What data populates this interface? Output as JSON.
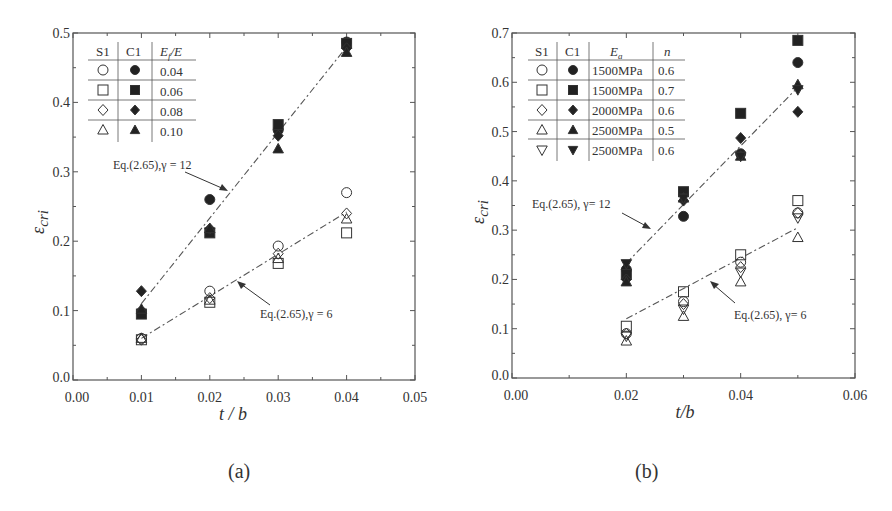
{
  "chart_data": [
    {
      "panel": "(a)",
      "type": "scatter",
      "xlabel": "t / b",
      "ylabel": "ε_cri",
      "xlim": [
        0.0,
        0.05
      ],
      "ylim": [
        0.0,
        0.5
      ],
      "xticks": [
        "0.00",
        "0.01",
        "0.02",
        "0.03",
        "0.04",
        "0.05"
      ],
      "yticks": [
        "0.0",
        "0.1",
        "0.2",
        "0.3",
        "0.4",
        "0.5"
      ],
      "grid": false,
      "legend": {
        "position": "upper-left",
        "headers": [
          "S1",
          "C1",
          "E_f/E"
        ],
        "rows": [
          {
            "s1": "open-circle",
            "c1": "filled-circle",
            "value": "0.04"
          },
          {
            "s1": "open-square",
            "c1": "filled-square",
            "value": "0.06"
          },
          {
            "s1": "open-diamond",
            "c1": "filled-diamond",
            "value": "0.08"
          },
          {
            "s1": "open-triangle-up",
            "c1": "filled-triangle-up",
            "value": "0.10"
          }
        ]
      },
      "x": [
        0.01,
        0.02,
        0.03,
        0.04
      ],
      "series": [
        {
          "name": "S1 Ef/E=0.04",
          "marker": "open-circle",
          "values": [
            0.06,
            0.128,
            0.193,
            0.27
          ]
        },
        {
          "name": "S1 Ef/E=0.06",
          "marker": "open-square",
          "values": [
            0.058,
            0.112,
            0.168,
            0.212
          ]
        },
        {
          "name": "S1 Ef/E=0.08",
          "marker": "open-diamond",
          "values": [
            0.058,
            0.118,
            0.182,
            0.24
          ]
        },
        {
          "name": "S1 Ef/E=0.10",
          "marker": "open-triangle-up",
          "values": [
            0.06,
            0.115,
            0.175,
            0.232
          ]
        },
        {
          "name": "C1 Ef/E=0.04",
          "marker": "filled-circle",
          "values": [
            0.098,
            0.26,
            0.36,
            0.487
          ]
        },
        {
          "name": "C1 Ef/E=0.06",
          "marker": "filled-square",
          "values": [
            0.095,
            0.212,
            0.368,
            0.485
          ]
        },
        {
          "name": "C1 Ef/E=0.08",
          "marker": "filled-diamond",
          "values": [
            0.128,
            0.218,
            0.352,
            0.478
          ]
        },
        {
          "name": "C1 Ef/E=0.10",
          "marker": "filled-triangle-up",
          "values": [
            0.102,
            0.218,
            0.333,
            0.472
          ]
        }
      ],
      "fit_lines": [
        {
          "label": "Eq.(2.65),γ = 12",
          "x": [
            0.01,
            0.04
          ],
          "y": [
            0.11,
            0.48
          ]
        },
        {
          "label": "Eq.(2.65),γ = 6",
          "x": [
            0.01,
            0.04
          ],
          "y": [
            0.06,
            0.242
          ]
        }
      ]
    },
    {
      "panel": "(b)",
      "type": "scatter",
      "xlabel": "t/b",
      "ylabel": "ε_cri",
      "xlim": [
        0.0,
        0.06
      ],
      "ylim": [
        0.0,
        0.7
      ],
      "xticks": [
        "0.00",
        "0.02",
        "0.04",
        "0.06"
      ],
      "yticks": [
        "0.0",
        "0.1",
        "0.2",
        "0.3",
        "0.4",
        "0.5",
        "0.6",
        "0.7"
      ],
      "grid": false,
      "legend": {
        "position": "upper-left",
        "headers": [
          "S1",
          "C1",
          "E_a",
          "n"
        ],
        "rows": [
          {
            "s1": "open-circle",
            "c1": "filled-circle",
            "ea": "1500MPa",
            "n": "0.6"
          },
          {
            "s1": "open-square",
            "c1": "filled-square",
            "ea": "1500MPa",
            "n": "0.7"
          },
          {
            "s1": "open-diamond",
            "c1": "filled-diamond",
            "ea": "2000MPa",
            "n": "0.6"
          },
          {
            "s1": "open-triangle-up",
            "c1": "filled-triangle-up",
            "ea": "2500MPa",
            "n": "0.5"
          },
          {
            "s1": "open-triangle-down",
            "c1": "filled-triangle-down",
            "ea": "2500MPa",
            "n": "0.6"
          }
        ]
      },
      "x": [
        0.02,
        0.03,
        0.04,
        0.05
      ],
      "series": [
        {
          "name": "S1 1500MPa n=0.6",
          "marker": "open-circle",
          "values": [
            0.09,
            0.155,
            0.235,
            0.335
          ]
        },
        {
          "name": "S1 1500MPa n=0.7",
          "marker": "open-square",
          "values": [
            0.105,
            0.175,
            0.25,
            0.36
          ]
        },
        {
          "name": "S1 2000MPa n=0.6",
          "marker": "open-diamond",
          "values": [
            0.09,
            0.15,
            0.225,
            0.335
          ]
        },
        {
          "name": "S1 2500MPa n=0.5",
          "marker": "open-triangle-up",
          "values": [
            0.075,
            0.125,
            0.195,
            0.285
          ]
        },
        {
          "name": "S1 2500MPa n=0.6",
          "marker": "open-triangle-down",
          "values": [
            0.085,
            0.14,
            0.215,
            0.325
          ]
        },
        {
          "name": "C1 1500MPa n=0.6",
          "marker": "filled-circle",
          "values": [
            0.22,
            0.328,
            0.455,
            0.64
          ]
        },
        {
          "name": "C1 1500MPa n=0.7",
          "marker": "filled-square",
          "values": [
            0.21,
            0.378,
            0.537,
            0.685
          ]
        },
        {
          "name": "C1 2000MPa n=0.6",
          "marker": "filled-diamond",
          "values": [
            0.2,
            0.36,
            0.487,
            0.54
          ]
        },
        {
          "name": "C1 2500MPa n=0.5",
          "marker": "filled-triangle-up",
          "values": [
            0.195,
            0.365,
            0.45,
            0.595
          ]
        },
        {
          "name": "C1 2500MPa n=0.6",
          "marker": "filled-triangle-down",
          "values": [
            0.232,
            0.365,
            0.45,
            0.585
          ]
        }
      ],
      "fit_lines": [
        {
          "label": "Eq.(2.65), γ= 12",
          "x": [
            0.02,
            0.05
          ],
          "y": [
            0.233,
            0.59
          ]
        },
        {
          "label": "Eq.(2.65), γ= 6",
          "x": [
            0.02,
            0.05
          ],
          "y": [
            0.12,
            0.305
          ]
        }
      ]
    }
  ],
  "captions": {
    "a": "(a)",
    "b": "(b)"
  },
  "panels": {
    "a": {
      "xlabel": "t / b",
      "ylabel_main": "ε",
      "ylabel_sub": "cri",
      "legend_headers": [
        "S1",
        "C1",
        "E",
        "f",
        "/E"
      ],
      "legend_values": [
        "0.04",
        "0.06",
        "0.08",
        "0.10"
      ],
      "annot_top": "Eq.(2.65),γ = 12",
      "annot_bottom": "Eq.(2.65),γ = 6"
    },
    "b": {
      "xlabel": "t/b",
      "ylabel_main": "ε",
      "ylabel_sub": "cri",
      "legend_headers": [
        "S1",
        "C1",
        "E",
        "a",
        "n"
      ],
      "legend_ea": [
        "1500MPa",
        "1500MPa",
        "2000MPa",
        "2500MPa",
        "2500MPa"
      ],
      "legend_n": [
        "0.6",
        "0.7",
        "0.6",
        "0.5",
        "0.6"
      ],
      "annot_top": "Eq.(2.65), γ= 12",
      "annot_bottom": "Eq.(2.65), γ= 6"
    }
  }
}
